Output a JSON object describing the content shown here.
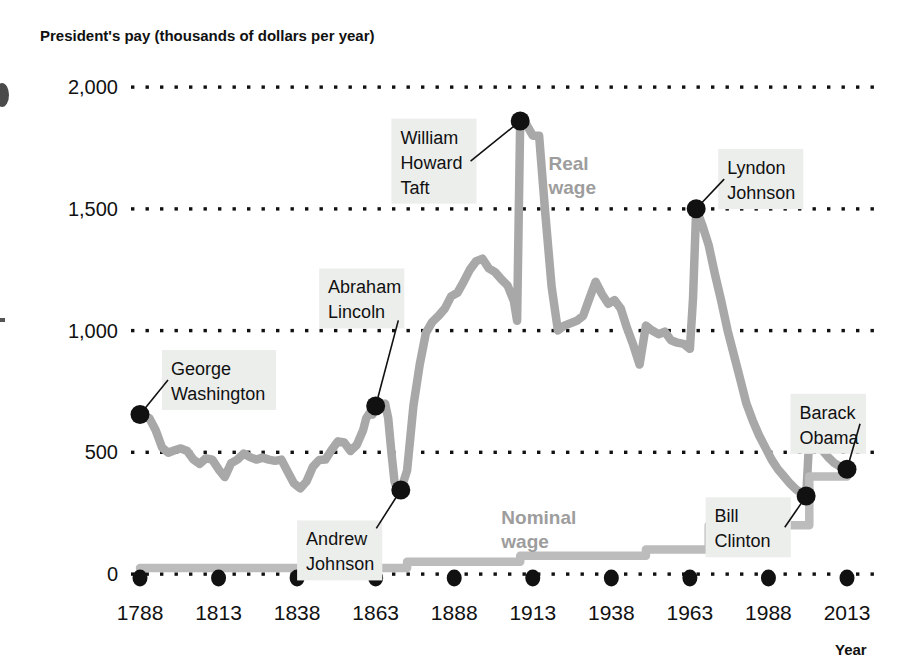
{
  "chart": {
    "title": "President's pay (thousands of dollars per year)",
    "xaxis_name": "Year"
  },
  "chart_data": {
    "type": "line",
    "title": "President's pay (thousands of dollars per year)",
    "xlabel": "Year",
    "ylabel": "President's pay (thousands of dollars per year)",
    "xlim": [
      1788,
      2013
    ],
    "ylim": [
      0,
      2000
    ],
    "grid": "horizontal-dotted",
    "legend": "inline-labels",
    "y_ticks": [
      0,
      500,
      1000,
      1500,
      2000
    ],
    "y_tick_labels": [
      "0",
      "500",
      "1,000",
      "1,500",
      "2,000"
    ],
    "x_ticks": [
      1788,
      1813,
      1838,
      1863,
      1888,
      1913,
      1938,
      1963,
      1988,
      2013
    ],
    "x_tick_labels": [
      "1788",
      "1813",
      "1838",
      "1863",
      "1888",
      "1913",
      "1938",
      "1963",
      "1988",
      "2013"
    ],
    "series": [
      {
        "name": "Real wage",
        "color": "#a8a8a8",
        "label_pos": [
          1918,
          1660
        ],
        "points": [
          [
            1788,
            655
          ],
          [
            1791,
            640
          ],
          [
            1793,
            590
          ],
          [
            1795,
            520
          ],
          [
            1797,
            498
          ],
          [
            1799,
            508
          ],
          [
            1801,
            516
          ],
          [
            1803,
            505
          ],
          [
            1805,
            470
          ],
          [
            1807,
            452
          ],
          [
            1809,
            475
          ],
          [
            1811,
            470
          ],
          [
            1813,
            430
          ],
          [
            1815,
            398
          ],
          [
            1817,
            455
          ],
          [
            1819,
            470
          ],
          [
            1821,
            495
          ],
          [
            1823,
            480
          ],
          [
            1825,
            470
          ],
          [
            1827,
            478
          ],
          [
            1829,
            470
          ],
          [
            1831,
            465
          ],
          [
            1833,
            470
          ],
          [
            1835,
            420
          ],
          [
            1837,
            372
          ],
          [
            1839,
            352
          ],
          [
            1841,
            380
          ],
          [
            1843,
            440
          ],
          [
            1845,
            468
          ],
          [
            1847,
            470
          ],
          [
            1849,
            510
          ],
          [
            1851,
            545
          ],
          [
            1853,
            540
          ],
          [
            1855,
            505
          ],
          [
            1857,
            530
          ],
          [
            1859,
            590
          ],
          [
            1860,
            640
          ],
          [
            1861,
            660
          ],
          [
            1862,
            655
          ],
          [
            1863,
            690
          ],
          [
            1864,
            700
          ],
          [
            1865,
            695
          ],
          [
            1866,
            700
          ],
          [
            1867,
            640
          ],
          [
            1868,
            500
          ],
          [
            1869,
            380
          ],
          [
            1870,
            340
          ],
          [
            1871,
            345
          ],
          [
            1873,
            425
          ],
          [
            1875,
            690
          ],
          [
            1877,
            860
          ],
          [
            1879,
            990
          ],
          [
            1881,
            1035
          ],
          [
            1883,
            1060
          ],
          [
            1885,
            1090
          ],
          [
            1887,
            1140
          ],
          [
            1889,
            1155
          ],
          [
            1891,
            1200
          ],
          [
            1893,
            1250
          ],
          [
            1895,
            1285
          ],
          [
            1897,
            1295
          ],
          [
            1899,
            1255
          ],
          [
            1901,
            1240
          ],
          [
            1903,
            1210
          ],
          [
            1905,
            1185
          ],
          [
            1907,
            1120
          ],
          [
            1908,
            1040
          ],
          [
            1909,
            1860
          ],
          [
            1911,
            1845
          ],
          [
            1913,
            1800
          ],
          [
            1915,
            1800
          ],
          [
            1917,
            1480
          ],
          [
            1919,
            1180
          ],
          [
            1921,
            1000
          ],
          [
            1923,
            1020
          ],
          [
            1925,
            1030
          ],
          [
            1927,
            1040
          ],
          [
            1929,
            1060
          ],
          [
            1931,
            1130
          ],
          [
            1933,
            1200
          ],
          [
            1935,
            1150
          ],
          [
            1937,
            1110
          ],
          [
            1939,
            1125
          ],
          [
            1941,
            1090
          ],
          [
            1943,
            1010
          ],
          [
            1945,
            940
          ],
          [
            1947,
            860
          ],
          [
            1949,
            1020
          ],
          [
            1951,
            1000
          ],
          [
            1953,
            985
          ],
          [
            1955,
            995
          ],
          [
            1957,
            960
          ],
          [
            1959,
            950
          ],
          [
            1961,
            945
          ],
          [
            1963,
            925
          ],
          [
            1964,
            1130
          ],
          [
            1965,
            1500
          ],
          [
            1967,
            1430
          ],
          [
            1969,
            1350
          ],
          [
            1971,
            1230
          ],
          [
            1973,
            1120
          ],
          [
            1975,
            1000
          ],
          [
            1977,
            900
          ],
          [
            1979,
            800
          ],
          [
            1981,
            700
          ],
          [
            1983,
            630
          ],
          [
            1985,
            570
          ],
          [
            1987,
            520
          ],
          [
            1989,
            470
          ],
          [
            1991,
            430
          ],
          [
            1993,
            400
          ],
          [
            1995,
            370
          ],
          [
            1997,
            345
          ],
          [
            1999,
            330
          ],
          [
            2000,
            320
          ],
          [
            2001,
            560
          ],
          [
            2003,
            540
          ],
          [
            2005,
            510
          ],
          [
            2007,
            480
          ],
          [
            2009,
            455
          ],
          [
            2011,
            440
          ],
          [
            2013,
            430
          ]
        ]
      },
      {
        "name": "Nominal wage",
        "color": "#bcbcbc",
        "label_pos": [
          1903,
          205
        ],
        "points": [
          [
            1788,
            25
          ],
          [
            1873,
            25
          ],
          [
            1873,
            50
          ],
          [
            1909,
            50
          ],
          [
            1909,
            75
          ],
          [
            1949,
            75
          ],
          [
            1949,
            100
          ],
          [
            1969,
            100
          ],
          [
            1969,
            200
          ],
          [
            2001,
            200
          ],
          [
            2001,
            400
          ],
          [
            2013,
            400
          ]
        ]
      }
    ],
    "annotations": [
      {
        "label": "George Washington",
        "lines": [
          "George",
          "Washington"
        ],
        "point": [
          1788,
          655
        ],
        "box": [
          1795,
          920
        ]
      },
      {
        "label": "Abraham Lincoln",
        "lines": [
          "Abraham",
          "Lincoln"
        ],
        "point": [
          1863,
          690
        ],
        "box": [
          1845,
          1255
        ]
      },
      {
        "label": "Andrew Johnson",
        "lines": [
          "Andrew",
          "Johnson"
        ],
        "point": [
          1871,
          345
        ],
        "box": [
          1838,
          220
        ]
      },
      {
        "label": "William Howard Taft",
        "lines": [
          "William",
          "Howard",
          "Taft"
        ],
        "point": [
          1909,
          1860
        ],
        "box": [
          1868,
          1870
        ]
      },
      {
        "label": "Lyndon Johnson",
        "lines": [
          "Lyndon",
          "Johnson"
        ],
        "point": [
          1965,
          1500
        ],
        "box": [
          1972,
          1745
        ]
      },
      {
        "label": "Bill Clinton",
        "lines": [
          "Bill",
          "Clinton"
        ],
        "point": [
          2000,
          320
        ],
        "box": [
          1968,
          315
        ]
      },
      {
        "label": "Barack Obama",
        "lines": [
          "Barack",
          "Obama"
        ],
        "point": [
          2013,
          430
        ],
        "box": [
          1995,
          740
        ]
      }
    ],
    "marker_years": [
      1788,
      1813,
      1838,
      1863,
      1888,
      1913,
      1938,
      1963,
      1988,
      2013
    ]
  },
  "colors": {
    "real_wage": "#a8a8a8",
    "nominal_wage": "#bcbcbc",
    "annotation_box": "#eceeec",
    "text": "#111111",
    "series_label": "#9d9d9d"
  }
}
